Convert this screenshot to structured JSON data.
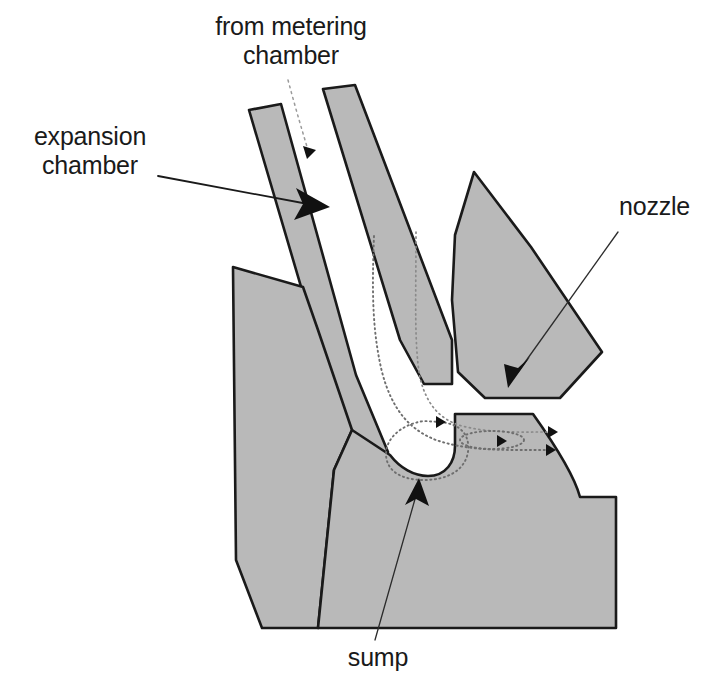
{
  "figure": {
    "background_color": "#ffffff",
    "metal_fill_color": "#b9b9b9",
    "outline_color": "#1a1a1a",
    "flowline_color": "#6e6e6e",
    "width": 719,
    "height": 690
  },
  "labels": {
    "from_metering_chamber": "from metering\nchamber",
    "expansion_chamber": "expansion\nchamber",
    "nozzle": "nozzle",
    "sump": "sump"
  },
  "callouts": [
    {
      "name": "from-metering-chamber",
      "text": "from metering\nchamber",
      "style": "dashed-arrow",
      "points_to": "inlet passage"
    },
    {
      "name": "expansion-chamber",
      "text": "expansion\nchamber",
      "style": "solid-arrow",
      "points_to": "expansion chamber passage"
    },
    {
      "name": "nozzle",
      "text": "nozzle",
      "style": "solid-arrow",
      "points_to": "nozzle outlet"
    },
    {
      "name": "sump",
      "text": "sump",
      "style": "solid-arrow",
      "points_to": "sump pocket"
    }
  ],
  "flow": {
    "description": "dotted streamlines from the metering chamber down the expansion chamber, out through the nozzle, with a recirculation loop in the sump",
    "streamline_count": 2,
    "recirculation_loops": 2
  }
}
